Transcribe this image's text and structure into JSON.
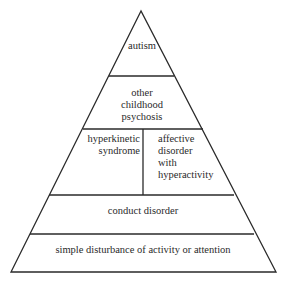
{
  "diagram": {
    "type": "pyramid",
    "levels": [
      {
        "label": "autism"
      },
      {
        "label_lines": [
          "other",
          "childhood",
          "psychosis"
        ]
      },
      {
        "split": [
          {
            "label_lines": [
              "hyperkinetic",
              "syndrome"
            ]
          },
          {
            "label_lines": [
              "affective",
              "disorder",
              "with",
              "hyperactivity"
            ]
          }
        ]
      },
      {
        "label": "conduct disorder"
      },
      {
        "label": "simple disturbance of activity or attention"
      }
    ]
  }
}
